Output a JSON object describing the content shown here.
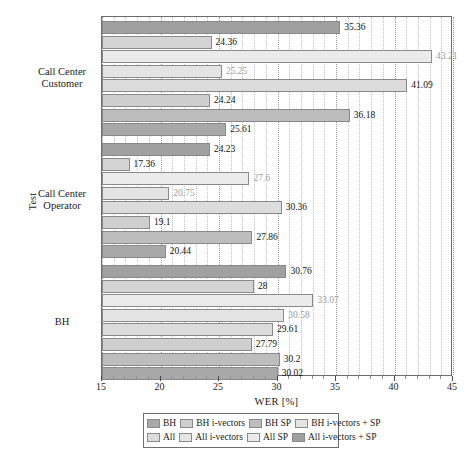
{
  "chart_data": {
    "type": "bar",
    "orientation": "horizontal",
    "title": "",
    "xlabel": "WER [%]",
    "ylabel": "Test",
    "xlim": [
      15,
      45
    ],
    "ylim": null,
    "grid": true,
    "xticks": [
      15,
      20,
      25,
      30,
      35,
      40,
      45
    ],
    "xtick_labels": [
      "15",
      "20",
      "25",
      "30",
      "35",
      "40",
      "45"
    ],
    "categories": [
      "Call Center Customer",
      "Call Center Operator",
      "BH"
    ],
    "legend_position": "bottom-outside",
    "series": [
      {
        "name": "BH",
        "color": "#a8a8a8",
        "values": [
          25.61,
          20.44,
          30.02
        ]
      },
      {
        "name": "BH i-vectors",
        "color": "#bdbdbd",
        "values": [
          36.18,
          27.86,
          30.2
        ]
      },
      {
        "name": "BH SP",
        "color": "#cfcfcf",
        "values": [
          24.24,
          19.1,
          27.79
        ]
      },
      {
        "name": "BH i-vectors + SP",
        "color": "#dcdcdc",
        "values": [
          41.09,
          30.36,
          29.61
        ]
      },
      {
        "name": "All",
        "color": "#e4e4e4",
        "values": [
          25.25,
          20.75,
          30.58
        ]
      },
      {
        "name": "All i-vectors",
        "color": "#ebebeb",
        "values": [
          43.21,
          27.6,
          33.07
        ]
      },
      {
        "name": "All SP",
        "color": "#d4d4d4",
        "values": [
          24.36,
          17.36,
          28
        ]
      },
      {
        "name": "All i-vectors + SP",
        "color": "#a0a0a0",
        "values": [
          35.36,
          24.23,
          30.76
        ]
      }
    ],
    "bar_value_labels": {
      "group_0": [
        "35.36",
        "24.36",
        "43.21",
        "25.25",
        "41.09",
        "24.24",
        "36.18",
        "25.61"
      ],
      "group_1": [
        "24.23",
        "17.36",
        "27.6",
        "20.75",
        "30.36",
        "19.1",
        "27.86",
        "20.44"
      ],
      "group_2": [
        "30.76",
        "28",
        "33.07",
        "30.58",
        "29.61",
        "27.79",
        "30.2",
        "30.02"
      ]
    }
  },
  "legend": {
    "row1": [
      {
        "label": "BH",
        "color": "#a8a8a8"
      },
      {
        "label": "BH i-vectors",
        "color": "#cfcfcf"
      },
      {
        "label": "BH SP",
        "color": "#bdbdbd"
      },
      {
        "label": "BH i-vectors + SP",
        "color": "#e4e4e4"
      }
    ],
    "row2": [
      {
        "label": "All",
        "color": "#dcdcdc"
      },
      {
        "label": "All i-vectors",
        "color": "#e4e4e4"
      },
      {
        "label": "All SP",
        "color": "#ebebeb"
      },
      {
        "label": "All i-vectors + SP",
        "color": "#a0a0a0"
      }
    ]
  },
  "axis": {
    "y_title": "Test",
    "x_title": "WER [%]",
    "category_labels": [
      {
        "line1": "Call Center",
        "line2": "Customer"
      },
      {
        "line1": "Call Center",
        "line2": "Operator"
      },
      {
        "line1": "BH",
        "line2": ""
      }
    ]
  }
}
